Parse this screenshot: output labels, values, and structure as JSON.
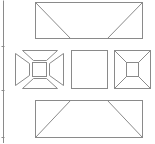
{
  "diagram": {
    "stroke_color": "#8a8a8a",
    "background": "#ffffff",
    "scale_line": {
      "x": 3,
      "y1": 0,
      "y2": 143,
      "ticks": [
        46,
        90,
        137
      ]
    },
    "top_view": {
      "rect": [
        35,
        2,
        107,
        36
      ],
      "diagonals": [
        [
          35,
          2,
          70,
          38
        ],
        [
          142,
          2,
          107,
          38
        ]
      ]
    },
    "bottom_view": {
      "rect": [
        35,
        100,
        107,
        37
      ],
      "diagonals": [
        [
          70,
          100,
          35,
          137
        ],
        [
          107,
          100,
          142,
          137
        ]
      ]
    },
    "left_view_exploded": {
      "outer": [
        15,
        50,
        48,
        38
      ],
      "inner_square": [
        32,
        62,
        14,
        14
      ],
      "top_trap": [
        [
          22,
          50
        ],
        [
          57,
          50
        ],
        [
          46,
          60
        ],
        [
          33,
          60
        ]
      ],
      "bottom_trap": [
        [
          22,
          88
        ],
        [
          57,
          88
        ],
        [
          46,
          78
        ],
        [
          33,
          78
        ]
      ],
      "left_trap": [
        [
          15,
          53
        ],
        [
          15,
          85
        ],
        [
          29,
          75
        ],
        [
          29,
          63
        ]
      ],
      "right_trap": [
        [
          63,
          53
        ],
        [
          63,
          85
        ],
        [
          49,
          75
        ],
        [
          49,
          63
        ]
      ]
    },
    "center_view": {
      "rect": [
        71,
        50,
        36,
        38
      ]
    },
    "right_view": {
      "rect": [
        114,
        50,
        36,
        38
      ],
      "inner_square": [
        126,
        62,
        12,
        14
      ],
      "connectors": [
        [
          114,
          50,
          126,
          62
        ],
        [
          150,
          50,
          138,
          62
        ],
        [
          114,
          88,
          126,
          76
        ],
        [
          150,
          88,
          138,
          76
        ]
      ]
    }
  }
}
